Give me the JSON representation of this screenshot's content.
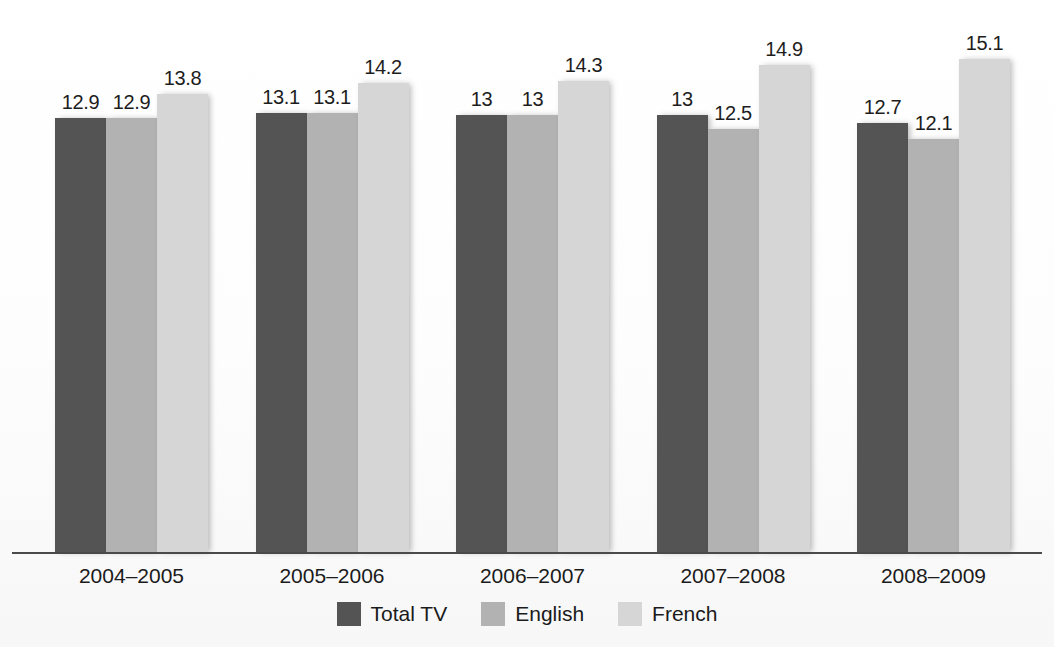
{
  "chart_data": {
    "type": "bar",
    "title": "",
    "subtitle": "",
    "xlabel": "",
    "ylabel": "",
    "grid": false,
    "legend_position": "bottom-center",
    "axis_note": "value axis not shown; bars drawn on a truncated scale with data labels above each bar",
    "categories": [
      "2004–2005",
      "2005–2006",
      "2006–2007",
      "2007–2008",
      "2008–2009"
    ],
    "series": [
      {
        "name": "Total TV",
        "color": "#545454",
        "values": [
          12.9,
          13.1,
          13,
          13,
          12.7
        ],
        "labels": [
          "12.9",
          "13.1",
          "13",
          "13",
          "12.7"
        ]
      },
      {
        "name": "English",
        "color": "#b2b2b2",
        "values": [
          12.9,
          13.1,
          13,
          12.5,
          12.1
        ],
        "labels": [
          "12.9",
          "13.1",
          "13",
          "12.5",
          "12.1"
        ]
      },
      {
        "name": "French",
        "color": "#d6d6d6",
        "values": [
          13.8,
          14.2,
          14.3,
          14.9,
          15.1
        ],
        "labels": [
          "13.8",
          "14.2",
          "14.3",
          "14.9",
          "15.1"
        ]
      }
    ]
  },
  "legend": {
    "items": [
      {
        "label": "Total TV",
        "color": "#545454"
      },
      {
        "label": "English",
        "color": "#b2b2b2"
      },
      {
        "label": "French",
        "color": "#d6d6d6"
      }
    ]
  },
  "axis": {
    "tick_labels": [
      "2004–2005",
      "2005–2006",
      "2006–2007",
      "2007–2008",
      "2008–2009"
    ],
    "baseline_color": "#4a4a4a"
  }
}
